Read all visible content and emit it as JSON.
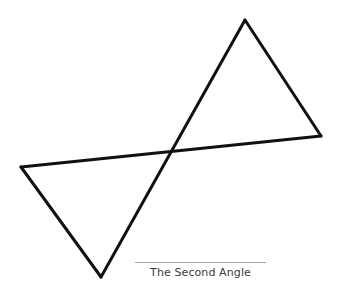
{
  "figure": {
    "title": "The Second Angle",
    "stroke_color": "#111111",
    "shapes": [
      {
        "name": "upper-right-triangle",
        "vertices": [
          [
            245,
            20
          ],
          [
            321,
            136
          ],
          [
            172,
            152
          ]
        ]
      },
      {
        "name": "lower-left-triangle",
        "vertices": [
          [
            21,
            167
          ],
          [
            101,
            277
          ],
          [
            172,
            152
          ]
        ]
      }
    ]
  },
  "caption": {
    "text": "The Second Angle"
  }
}
